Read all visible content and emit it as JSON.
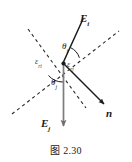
{
  "figure": {
    "caption": "图 2.30",
    "caption_number": "2.30",
    "caption_prefix": "图"
  },
  "labels": {
    "incident_vector": {
      "symbol": "E",
      "subscript": "i",
      "name": "E_i"
    },
    "reflected_vector": {
      "symbol": "E",
      "subscript": "j",
      "name": "E_j"
    },
    "normal_vector": {
      "symbol": "n",
      "subscript": "",
      "name": "n"
    },
    "angle_incidence": {
      "symbol": "θ",
      "subscript": "i",
      "name": "theta_i"
    },
    "angle_reflection": {
      "symbol": "θ",
      "subscript": "j",
      "name": "theta_j"
    },
    "epsilon_left": {
      "symbol": "ε",
      "subscript": "ri",
      "name": "epsilon_ri"
    },
    "epsilon_right": {
      "symbol": "ε",
      "subscript": "rj",
      "name": "epsilon_rj"
    }
  },
  "colors": {
    "stroke_dark": "#1a1a1a",
    "stroke_gray": "#7d7d7d",
    "dashed": "#2a2a2a",
    "background": "#ffffff",
    "text": "#1a1a1a"
  },
  "geometry": {
    "vertex": {
      "x": 63,
      "y": 63
    },
    "incident_ray_end": {
      "x": 83,
      "y": 19
    },
    "reflected_ray_end": {
      "x": 63,
      "y": 131
    },
    "normal_ray_end": {
      "x": 106,
      "y": 106
    },
    "dashed_line_1": {
      "x1": 28,
      "y1": 29,
      "x2": 86,
      "y2": 108
    },
    "dashed_line_2": {
      "x1": 12,
      "y1": 114,
      "x2": 119,
      "y2": 31
    },
    "arc_theta_i_radius": 17,
    "arc_theta_j_radius": 19
  }
}
